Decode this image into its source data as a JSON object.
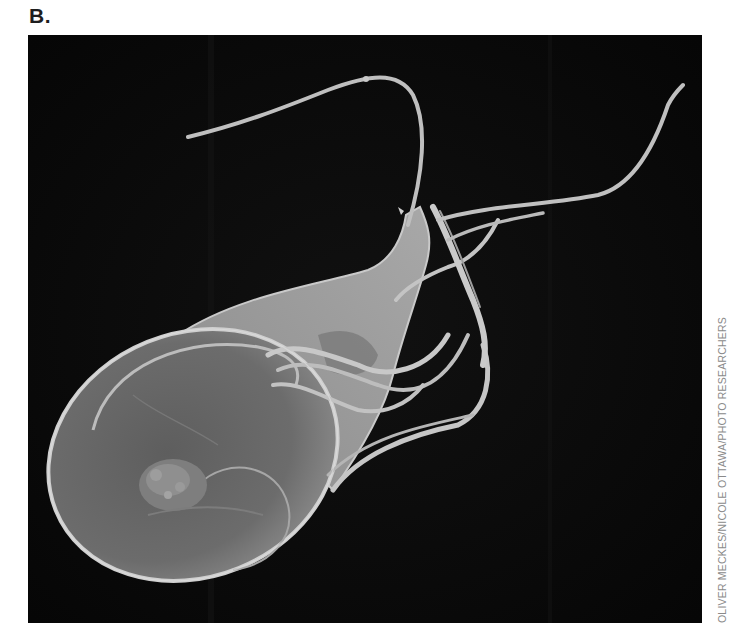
{
  "figure": {
    "panel_label": "B.",
    "photo_subject": "scanning electron micrograph of a flagellated protozoan (Giardia trophozoite)",
    "photo_credit": "OLIVER MECKES/NICOLE OTTAWA/PHOTO RESEARCHERS",
    "colors": {
      "background": "#ffffff",
      "photo_background": "#0b0b0b",
      "cell_body": "#6f6f6f",
      "flagella": "#bdbdbd",
      "label_text": "#1e1e1e",
      "credit_text": "#8a8a8a"
    }
  }
}
